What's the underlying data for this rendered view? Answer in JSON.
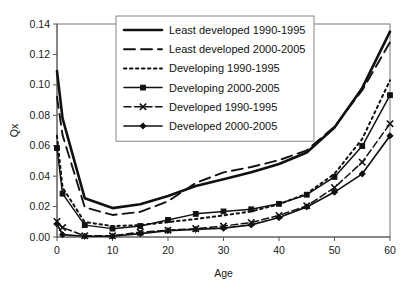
{
  "chart_data": {
    "type": "line",
    "title": "",
    "xlabel": "Age",
    "ylabel": "Qx",
    "xlim": [
      0,
      60
    ],
    "ylim": [
      0.0,
      0.14
    ],
    "grid": false,
    "legend_position": "upper-center-inside",
    "x_ticks": [
      "0",
      "10",
      "20",
      "30",
      "40",
      "50",
      "60"
    ],
    "x_tick_values": [
      0,
      10,
      20,
      30,
      40,
      50,
      60
    ],
    "y_ticks": [
      "0.00",
      "0.02",
      "0.04",
      "0.06",
      "0.08",
      "0.10",
      "0.12",
      "0.14"
    ],
    "y_tick_values": [
      0.0,
      0.02,
      0.04,
      0.06,
      0.08,
      0.1,
      0.12,
      0.14
    ],
    "x": [
      0,
      1,
      5,
      10,
      15,
      20,
      25,
      30,
      35,
      40,
      45,
      50,
      55,
      60
    ],
    "series": [
      {
        "name": "Least developed 1990-1995",
        "style": "solid-thick",
        "marker": "none",
        "values": [
          0.109,
          0.078,
          0.0255,
          0.019,
          0.0215,
          0.027,
          0.0335,
          0.038,
          0.0425,
          0.048,
          0.0555,
          0.072,
          0.098,
          0.135
        ]
      },
      {
        "name": "Least developed 2000-2005",
        "style": "long-dash",
        "marker": "none",
        "values": [
          0.092,
          0.067,
          0.0195,
          0.0145,
          0.0165,
          0.0235,
          0.0355,
          0.0425,
          0.046,
          0.0505,
          0.057,
          0.0725,
          0.0965,
          0.128
        ]
      },
      {
        "name": "Developing 1990-1995",
        "style": "dotted",
        "marker": "none",
        "values": [
          0.0665,
          0.0325,
          0.0098,
          0.0072,
          0.0078,
          0.0098,
          0.0118,
          0.0142,
          0.0168,
          0.0215,
          0.0285,
          0.0415,
          0.0645,
          0.103
        ]
      },
      {
        "name": "Developing 2000-2005",
        "style": "solid-square",
        "marker": "square",
        "values": [
          0.0585,
          0.0285,
          0.0078,
          0.0055,
          0.0072,
          0.0112,
          0.0152,
          0.0168,
          0.0182,
          0.0218,
          0.0278,
          0.0395,
          0.0598,
          0.0932
        ]
      },
      {
        "name": "Developed 1990-1995",
        "style": "dash-x",
        "marker": "x",
        "values": [
          0.0102,
          0.0062,
          0.0008,
          0.0008,
          0.0032,
          0.0045,
          0.0055,
          0.0072,
          0.0095,
          0.0142,
          0.0205,
          0.0325,
          0.0492,
          0.0745
        ]
      },
      {
        "name": "Developed 2000-2005",
        "style": "solid-diamond",
        "marker": "diamond",
        "values": [
          0.0085,
          0.0015,
          0.0005,
          0.0005,
          0.0022,
          0.0042,
          0.005,
          0.0058,
          0.008,
          0.0128,
          0.0198,
          0.0295,
          0.0415,
          0.0665
        ]
      }
    ]
  },
  "legend": {
    "entries": [
      {
        "label": "Least developed 1990-1995"
      },
      {
        "label": "Least developed 2000-2005"
      },
      {
        "label": "Developing 1990-1995"
      },
      {
        "label": "Developing 2000-2005"
      },
      {
        "label": "Developed 1990-1995"
      },
      {
        "label": "Developed 2000-2005"
      }
    ]
  },
  "colors": {
    "ink": "#111111",
    "axis": "#555555",
    "background": "#ffffff",
    "legend_border": "#888888"
  }
}
